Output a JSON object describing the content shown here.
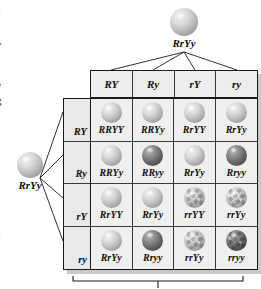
{
  "margin_text": {
    "fragments": [
      {
        "char": "s",
        "top": 4
      },
      {
        "char": "y",
        "top": 38
      },
      {
        "char": "e",
        "top": 78
      },
      {
        "char": "g",
        "top": 94
      },
      {
        "char": "s",
        "top": 228
      }
    ]
  },
  "parents": {
    "top": {
      "label": "RrYy",
      "sphere": "smooth-yellow-sphere"
    },
    "left": {
      "label": "RrYy",
      "sphere": "smooth-yellow-sphere"
    }
  },
  "punnett": {
    "column_headers": [
      "RY",
      "Ry",
      "rY",
      "ry"
    ],
    "row_headers": [
      "RY",
      "Ry",
      "rY",
      "ry"
    ],
    "rows": [
      {
        "header": "RY",
        "cells": [
          {
            "genotype": "RRYY",
            "phenotype": "round-yellow",
            "sphere": "smooth-yellow-sphere"
          },
          {
            "genotype": "RRYy",
            "phenotype": "round-yellow",
            "sphere": "smooth-yellow-sphere"
          },
          {
            "genotype": "RrYY",
            "phenotype": "round-yellow",
            "sphere": "smooth-yellow-sphere"
          },
          {
            "genotype": "RrYy",
            "phenotype": "round-yellow",
            "sphere": "smooth-yellow-sphere"
          }
        ]
      },
      {
        "header": "Ry",
        "cells": [
          {
            "genotype": "RRYy",
            "phenotype": "round-yellow",
            "sphere": "smooth-yellow-sphere"
          },
          {
            "genotype": "RRyy",
            "phenotype": "round-green",
            "sphere": "smooth-green-sphere"
          },
          {
            "genotype": "RrYy",
            "phenotype": "round-yellow",
            "sphere": "smooth-yellow-sphere"
          },
          {
            "genotype": "Rryy",
            "phenotype": "round-green",
            "sphere": "smooth-green-sphere"
          }
        ]
      },
      {
        "header": "rY",
        "cells": [
          {
            "genotype": "RrYY",
            "phenotype": "round-yellow",
            "sphere": "smooth-yellow-sphere"
          },
          {
            "genotype": "RrYy",
            "phenotype": "round-yellow",
            "sphere": "smooth-yellow-sphere"
          },
          {
            "genotype": "rrYY",
            "phenotype": "wrinkled-yellow",
            "sphere": "wrinkled-yellow-sphere"
          },
          {
            "genotype": "rrYy",
            "phenotype": "wrinkled-yellow",
            "sphere": "wrinkled-yellow-sphere"
          }
        ]
      },
      {
        "header": "ry",
        "cells": [
          {
            "genotype": "RrYy",
            "phenotype": "round-yellow",
            "sphere": "smooth-yellow-sphere"
          },
          {
            "genotype": "Rryy",
            "phenotype": "round-green",
            "sphere": "smooth-green-sphere"
          },
          {
            "genotype": "rrYy",
            "phenotype": "wrinkled-yellow",
            "sphere": "wrinkled-yellow-sphere"
          },
          {
            "genotype": "rryy",
            "phenotype": "wrinkled-green",
            "sphere": "wrinkled-green-sphere"
          }
        ]
      }
    ]
  },
  "colors": {
    "line": "#1a1a1a",
    "cell_background": "#efefef",
    "header_background": "#ededed",
    "shadow": "#c9c9c9"
  }
}
